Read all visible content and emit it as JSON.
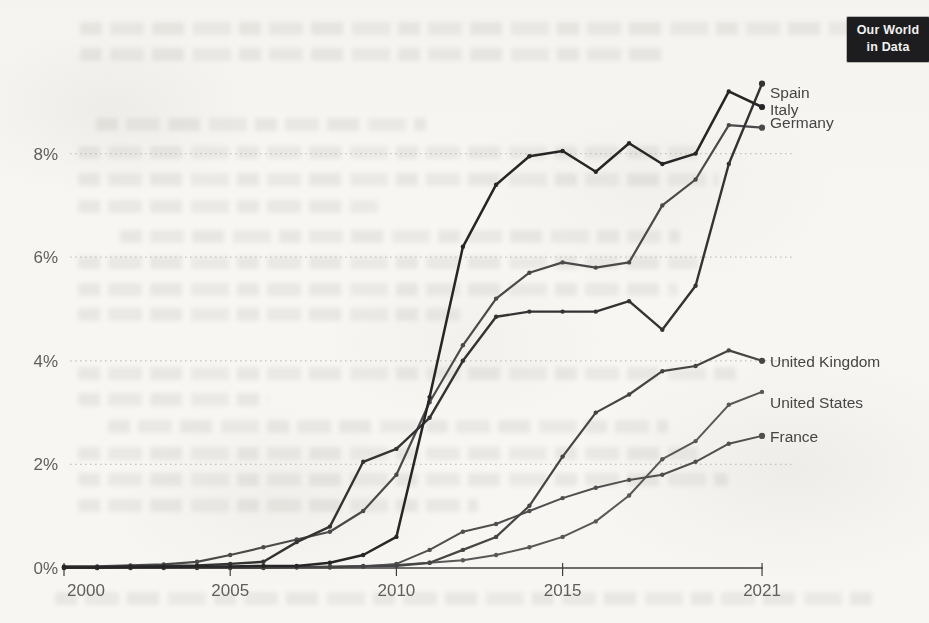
{
  "page": {
    "badge": {
      "line1": "Our World",
      "line2": "in Data"
    }
  },
  "chart_data": {
    "type": "line",
    "title": "",
    "xlabel": "",
    "ylabel": "",
    "xlim": [
      2000,
      2021
    ],
    "ylim": [
      0,
      9.5
    ],
    "grid": "horizontal dotted gridlines at each y tick",
    "legend_position": "labels at right end of each line",
    "x": [
      2000,
      2001,
      2002,
      2003,
      2004,
      2005,
      2006,
      2007,
      2008,
      2009,
      2010,
      2011,
      2012,
      2013,
      2014,
      2015,
      2016,
      2017,
      2018,
      2019,
      2020,
      2021
    ],
    "x_ticks": [
      {
        "year": 2000,
        "label": "2000"
      },
      {
        "year": 2005,
        "label": "2005"
      },
      {
        "year": 2010,
        "label": "2010"
      },
      {
        "year": 2015,
        "label": "2015"
      },
      {
        "year": 2021,
        "label": "2021"
      }
    ],
    "y_ticks": [
      {
        "value": 0,
        "label": "0%"
      },
      {
        "value": 2,
        "label": "2%"
      },
      {
        "value": 4,
        "label": "4%"
      },
      {
        "value": 6,
        "label": "6%"
      },
      {
        "value": 8,
        "label": "8%"
      }
    ],
    "series": [
      {
        "name": "Spain",
        "values": [
          0.02,
          0.02,
          0.03,
          0.04,
          0.05,
          0.08,
          0.12,
          0.5,
          0.8,
          2.05,
          2.3,
          2.9,
          4.0,
          4.85,
          4.95,
          4.95,
          4.95,
          5.15,
          4.6,
          5.45,
          7.8,
          9.35
        ],
        "color": "#333333",
        "end_dot": true,
        "label_dy": 9
      },
      {
        "name": "Italy",
        "values": [
          0.01,
          0.01,
          0.02,
          0.02,
          0.03,
          0.03,
          0.04,
          0.04,
          0.1,
          0.25,
          0.6,
          3.3,
          6.2,
          7.4,
          7.95,
          8.05,
          7.65,
          8.2,
          7.8,
          8.0,
          9.2,
          8.9
        ],
        "color": "#262626",
        "end_dot": true,
        "label_dy": 2
      },
      {
        "name": "Germany",
        "values": [
          0.03,
          0.03,
          0.05,
          0.07,
          0.12,
          0.25,
          0.4,
          0.55,
          0.7,
          1.1,
          1.8,
          3.2,
          4.3,
          5.2,
          5.7,
          5.9,
          5.8,
          5.9,
          7.0,
          7.5,
          8.55,
          8.5
        ],
        "color": "#4a4a4a",
        "end_dot": true,
        "label_dy": -5
      },
      {
        "name": "United Kingdom",
        "values": [
          0,
          0,
          0,
          0.01,
          0.01,
          0.01,
          0.01,
          0.02,
          0.02,
          0.03,
          0.04,
          0.1,
          0.35,
          0.6,
          1.2,
          2.15,
          3.0,
          3.35,
          3.8,
          3.9,
          4.2,
          4.0
        ],
        "color": "#454545",
        "end_dot": true,
        "label_dy": 1
      },
      {
        "name": "United States",
        "values": [
          0.01,
          0.01,
          0.01,
          0.01,
          0.01,
          0.01,
          0.01,
          0.02,
          0.03,
          0.04,
          0.06,
          0.1,
          0.15,
          0.25,
          0.4,
          0.6,
          0.9,
          1.4,
          2.1,
          2.45,
          3.15,
          3.4
        ],
        "color": "#585858",
        "end_dot": false,
        "label_dy": 11
      },
      {
        "name": "France",
        "values": [
          0,
          0,
          0,
          0,
          0,
          0,
          0,
          0.01,
          0.01,
          0.03,
          0.08,
          0.35,
          0.7,
          0.85,
          1.1,
          1.35,
          1.55,
          1.7,
          1.8,
          2.05,
          2.4,
          2.55
        ],
        "color": "#4f4f4f",
        "end_dot": true,
        "label_dy": 1
      }
    ]
  }
}
